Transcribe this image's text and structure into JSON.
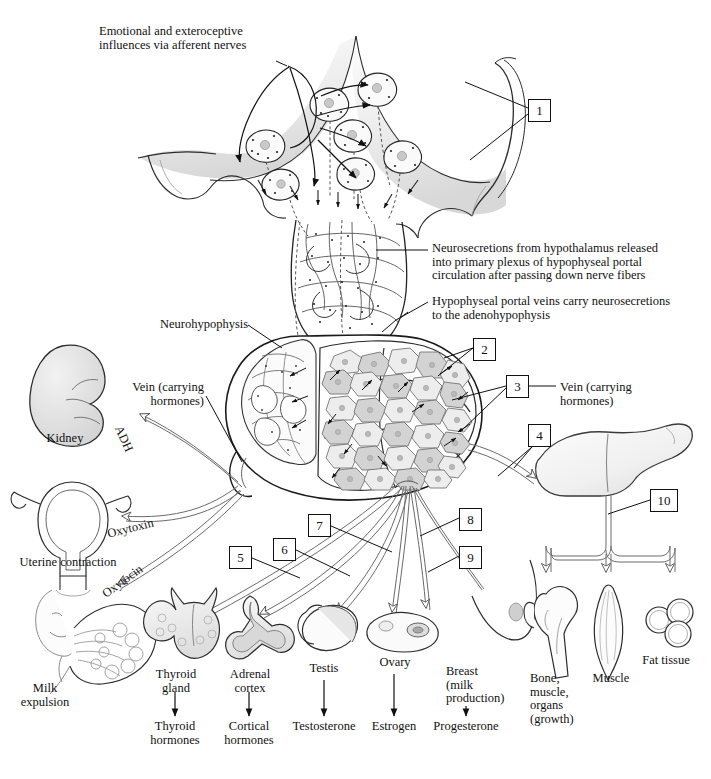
{
  "figure": {
    "domain": "anatomical-diagram",
    "background_color": "#ffffff",
    "ink_color": "#111111",
    "tissue_fill": "#e8e8e8",
    "cell_fill_light": "#ededed",
    "cell_fill_dark": "#cfcfcf"
  },
  "callout_labels": {
    "afferent_nerves": "Emotional and exteroceptive\ninfluences via afferent nerves",
    "neurosecretions": "Neurosecretions from hypothalamus released\ninto primary plexus of hypophyseal portal\ncirculation after passing down nerve fibers",
    "portal_veins": "Hypophyseal portal veins carry neurosecretions\nto the adenohypophysis",
    "neurohypophysis": "Neurohypophysis",
    "vein_left": "Vein (carrying\nhormones)",
    "vein_right": "Vein (carrying\nhormones)"
  },
  "hormone_paths": [
    {
      "name": "ADH",
      "label": "ADH"
    },
    {
      "name": "oxytoxin",
      "label": "Oxytoxin"
    },
    {
      "name": "oxytocin",
      "label": "Oxytocin"
    }
  ],
  "number_boxes": [
    {
      "id": "1",
      "label": "1",
      "x": 528,
      "y": 99
    },
    {
      "id": "2",
      "label": "2",
      "x": 473,
      "y": 338
    },
    {
      "id": "3",
      "label": "3",
      "x": 506,
      "y": 375
    },
    {
      "id": "4",
      "label": "4",
      "x": 528,
      "y": 424
    },
    {
      "id": "5",
      "label": "5",
      "x": 229,
      "y": 546
    },
    {
      "id": "6",
      "label": "6",
      "x": 273,
      "y": 538
    },
    {
      "id": "7",
      "label": "7",
      "x": 308,
      "y": 514
    },
    {
      "id": "8",
      "label": "8",
      "x": 459,
      "y": 508
    },
    {
      "id": "9",
      "label": "9",
      "x": 459,
      "y": 546
    },
    {
      "id": "10",
      "label": "10",
      "x": 650,
      "y": 489
    }
  ],
  "organs": [
    {
      "name": "kidney",
      "label": "Kidney",
      "x": 60,
      "y": 438
    },
    {
      "name": "uterus",
      "label": "Uterine contraction",
      "x": 62,
      "y": 562
    },
    {
      "name": "breast-milk",
      "label": "Milk\nexpulsion",
      "x": 40,
      "y": 688
    },
    {
      "name": "thyroid-gland",
      "label": "Thyroid\ngland",
      "x": 175,
      "y": 672
    },
    {
      "name": "adrenal-cortex",
      "label": "Adrenal\ncortex",
      "x": 249,
      "y": 672
    },
    {
      "name": "testis",
      "label": "Testis",
      "x": 324,
      "y": 666
    },
    {
      "name": "ovary",
      "label": "Ovary",
      "x": 394,
      "y": 660
    },
    {
      "name": "breast-production",
      "label": "Breast\n(milk\nproduction)",
      "x": 466,
      "y": 672
    },
    {
      "name": "bone-muscle-organs",
      "label": "Bone,\nmuscle,\norgans\n(growth)",
      "x": 551,
      "y": 676
    },
    {
      "name": "muscle",
      "label": "Muscle",
      "x": 612,
      "y": 676
    },
    {
      "name": "fat-tissue",
      "label": "Fat tissue",
      "x": 663,
      "y": 661
    }
  ],
  "hormone_outputs": [
    {
      "name": "thyroid-hormones",
      "label": "Thyroid\nhormones",
      "x": 175,
      "y": 724,
      "arrow_x": 175,
      "arrow_y0": 690,
      "arrow_y1": 716
    },
    {
      "name": "cortical-hormones",
      "label": "Cortical\nhormones",
      "x": 249,
      "y": 724,
      "arrow_x": 249,
      "arrow_y0": 690,
      "arrow_y1": 716
    },
    {
      "name": "testosterone",
      "label": "Testosterone",
      "x": 324,
      "y": 724,
      "arrow_x": 324,
      "arrow_y0": 678,
      "arrow_y1": 716
    },
    {
      "name": "estrogen",
      "label": "Estrogen",
      "x": 394,
      "y": 724,
      "arrow_x": 394,
      "arrow_y0": 672,
      "arrow_y1": 716
    },
    {
      "name": "progesterone",
      "label": "Progesterone",
      "x": 466,
      "y": 724,
      "arrow_x": 466,
      "arrow_y0": 704,
      "arrow_y1": 716
    }
  ]
}
